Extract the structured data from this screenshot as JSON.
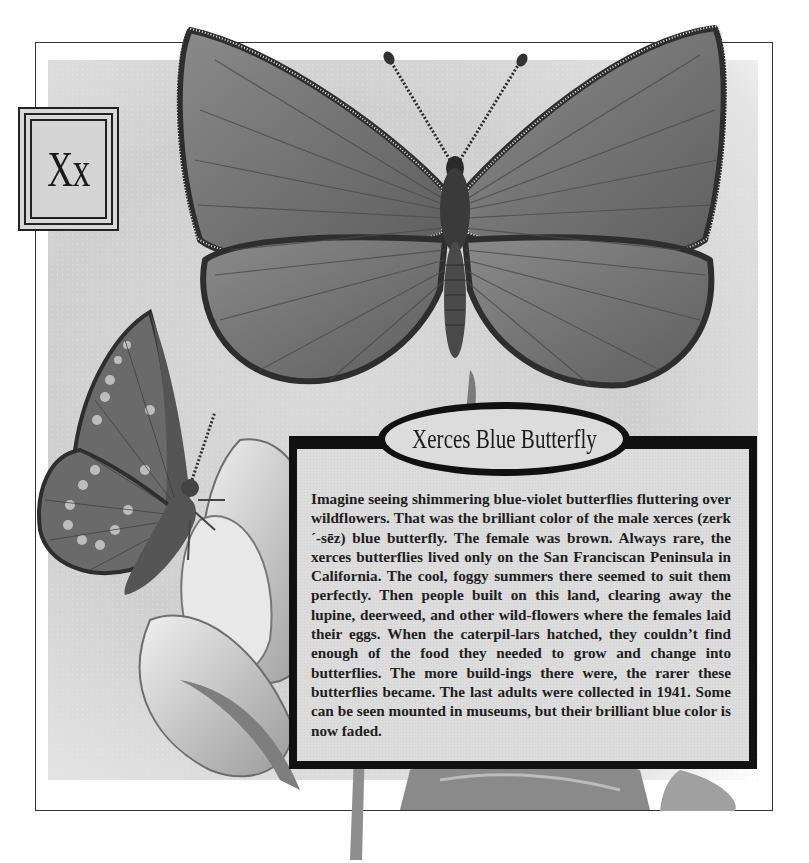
{
  "page": {
    "letter_label": "Xx",
    "title": "Xerces Blue Butterfly",
    "body": "Imagine seeing shimmering blue-violet butterflies fluttering over wildflowers. That was the brilliant color of the male xerces (zerk´-sēz) blue butterfly. The female was brown. Always rare, the xerces butterflies lived only on the San Franciscan Peninsula in California. The cool, foggy summers there seemed to suit them perfectly. Then people built on this land, clearing away the lupine, deerweed, and other wild-flowers where the females laid their eggs. When the caterpil-lars hatched, they couldn’t find enough of the food they needed to grow and change into butterflies. The more build-ings there were, the rarer these butterflies became. The last adults were collected in 1941. Some can be seen mounted in museums, but their brilliant blue color is now faded."
  },
  "illustrations": {
    "main": "male-xerces-blue-butterfly-open-wings",
    "secondary": "xerces-butterfly-side-view-on-lupine-flower",
    "flower": "lupine-flower-petals"
  },
  "colors": {
    "frame": "#333333",
    "border": "#111111",
    "panel": "#dcdcdc",
    "wing": "#6e6e6e",
    "wing_edge": "#2e2e2e"
  }
}
